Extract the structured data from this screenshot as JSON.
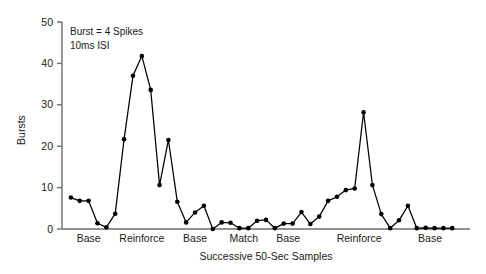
{
  "chart_data": {
    "type": "line",
    "title": "",
    "subtitle": "",
    "xlabel": "Successive 50-Sec Samples",
    "ylabel": "Bursts",
    "xlim": [
      0,
      46
    ],
    "ylim": [
      0,
      50
    ],
    "yticks": [
      0,
      10,
      20,
      30,
      40,
      50
    ],
    "ytick_labels": [
      "0",
      "10",
      "20",
      "30",
      "40",
      "50"
    ],
    "xtick_labels": [],
    "grid": false,
    "legend": null,
    "marker": "filled-circle",
    "line_color": "#000000",
    "marker_color": "#000000",
    "annotations": [
      "Burst = 4 Spikes",
      "10ms ISI"
    ],
    "x_group_labels": [
      {
        "label": "Base",
        "center_x": 3.0
      },
      {
        "label": "Reinforce",
        "center_x": 9.0
      },
      {
        "label": "Base",
        "center_x": 15.0
      },
      {
        "label": "Match",
        "center_x": 20.5
      },
      {
        "label": "Base",
        "center_x": 25.5
      },
      {
        "label": "Reinforce",
        "center_x": 33.5
      },
      {
        "label": "Base",
        "center_x": 41.5
      }
    ],
    "series": [
      {
        "name": "Bursts per 50-sec sample",
        "x": [
          1,
          2,
          3,
          4,
          5,
          6,
          7,
          8,
          9,
          10,
          11,
          12,
          13,
          14,
          15,
          16,
          17,
          18,
          19,
          20,
          21,
          22,
          23,
          24,
          25,
          26,
          27,
          28,
          29,
          30,
          31,
          32,
          33,
          34,
          35,
          36,
          37,
          38,
          39,
          40,
          41,
          42,
          43,
          44
        ],
        "values": [
          7.6,
          6.8,
          6.8,
          1.4,
          0.4,
          3.7,
          21.7,
          37.0,
          41.8,
          33.6,
          10.6,
          21.5,
          6.6,
          1.6,
          4.0,
          5.6,
          0.0,
          1.6,
          1.5,
          0.2,
          0.2,
          2.0,
          2.2,
          0.2,
          1.3,
          1.3,
          4.1,
          1.2,
          3.0,
          6.8,
          7.8,
          9.4,
          9.8,
          28.2,
          10.6,
          3.6,
          0.2,
          2.1,
          5.6,
          0.2,
          0.3,
          0.2,
          0.2,
          0.2
        ]
      }
    ]
  },
  "axes": {
    "y_axis_label": "Bursts",
    "x_axis_label": "Successive 50-Sec Samples"
  }
}
